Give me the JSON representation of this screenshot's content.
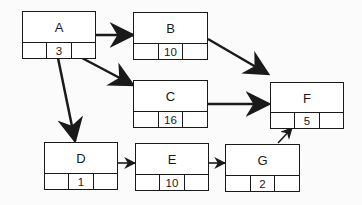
{
  "diagram": {
    "type": "activity-on-node network",
    "nodes": [
      {
        "id": "A",
        "label": "A",
        "duration": "3"
      },
      {
        "id": "B",
        "label": "B",
        "duration": "10"
      },
      {
        "id": "C",
        "label": "C",
        "duration": "16"
      },
      {
        "id": "D",
        "label": "D",
        "duration": "1"
      },
      {
        "id": "E",
        "label": "E",
        "duration": "10"
      },
      {
        "id": "F",
        "label": "F",
        "duration": "5"
      },
      {
        "id": "G",
        "label": "G",
        "duration": "2"
      }
    ],
    "edges": [
      {
        "from": "A",
        "to": "B"
      },
      {
        "from": "A",
        "to": "C"
      },
      {
        "from": "A",
        "to": "D"
      },
      {
        "from": "B",
        "to": "F"
      },
      {
        "from": "C",
        "to": "F"
      },
      {
        "from": "D",
        "to": "E"
      },
      {
        "from": "E",
        "to": "G"
      },
      {
        "from": "G",
        "to": "F"
      }
    ],
    "colors": {
      "stroke": "#1a1a1a",
      "fill": "#ffffff",
      "background": "#fbfbfb"
    }
  }
}
